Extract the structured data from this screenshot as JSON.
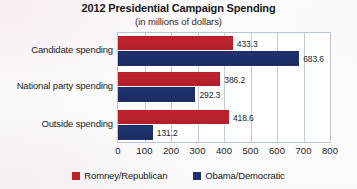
{
  "chart_data": {
    "type": "bar",
    "orientation": "horizontal",
    "title": "2012 Presidential Campaign Spending",
    "subtitle": "(in millions of dollars)",
    "xlabel": "",
    "ylabel": "",
    "xlim": [
      0,
      800
    ],
    "xticks": [
      "0",
      "100",
      "200",
      "300",
      "400",
      "500",
      "600",
      "700",
      "800"
    ],
    "grid": true,
    "legend_position": "bottom",
    "categories": [
      "Candidate spending",
      "National party spending",
      "Outside spending"
    ],
    "series": [
      {
        "name": "Romney/Republican",
        "color": "#bc2029",
        "values": [
          433.3,
          386.2,
          418.6
        ],
        "labels": [
          "433.3",
          "386.2",
          "418.6"
        ]
      },
      {
        "name": "Obama/Democratic",
        "color": "#1f3270",
        "values": [
          683.6,
          292.3,
          131.2
        ],
        "labels": [
          "683.6",
          "292.3",
          "131.2"
        ]
      }
    ]
  },
  "legend": {
    "items": [
      {
        "label": "Romney/Republican",
        "swatch": "rep"
      },
      {
        "label": "Obama/Democratic",
        "swatch": "dem"
      }
    ]
  }
}
